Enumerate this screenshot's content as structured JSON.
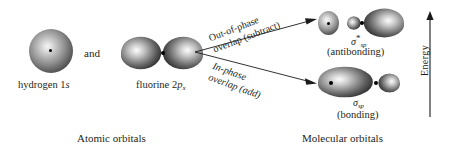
{
  "figure": {
    "atomic_orbitals_caption": "Atomic orbitals",
    "molecular_orbitals_caption": "Molecular orbitals",
    "conjunction": "and",
    "energy_axis_label": "Energy"
  },
  "atomic": {
    "hydrogen": {
      "name": "hydrogen",
      "orbital_prefix": "1",
      "orbital_letter": "s",
      "shape": "sphere"
    },
    "fluorine": {
      "name": "fluorine",
      "orbital_prefix": "2",
      "orbital_letter": "p",
      "orbital_subscript": "x",
      "shape": "two-lobe-dumbbell"
    }
  },
  "processes": [
    {
      "line1": "Out-of-phase",
      "line2": "overlap (subtract)",
      "direction": "up-right",
      "style": "upright"
    },
    {
      "line1": "In-phase",
      "line2": "overlap (add)",
      "direction": "down-right",
      "style": "italic"
    }
  ],
  "molecular": {
    "antibonding": {
      "sigma": "σ",
      "superscript": "*",
      "subscript": "sp",
      "descriptor": "(antibonding)",
      "shape": "small-lobe-node-large-lobe"
    },
    "bonding": {
      "sigma": "σ",
      "superscript": "",
      "subscript": "sp",
      "descriptor": "(bonding)",
      "shape": "large-lobe-small-lobe"
    }
  },
  "colors": {
    "text": "#231f20",
    "orbital_dark": "#262626",
    "orbital_light": "#fafafa",
    "background": "#ffffff",
    "arrow": "#1b1b1b"
  }
}
